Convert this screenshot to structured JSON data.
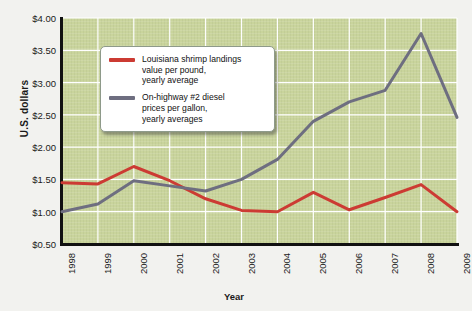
{
  "chart_data": {
    "type": "line",
    "title": "",
    "xlabel": "Year",
    "ylabel": "U.S. dollars",
    "categories": [
      "1998",
      "1999",
      "2000",
      "2001",
      "2002",
      "2003",
      "2004",
      "2005",
      "2006",
      "2007",
      "2008",
      "2009"
    ],
    "ylim": [
      0.5,
      4.0
    ],
    "yticks": [
      "$0.50",
      "$1.00",
      "$1.50",
      "$2.00",
      "$2.50",
      "$3.00",
      "$3.50",
      "$4.00"
    ],
    "ytick_values": [
      0.5,
      1.0,
      1.5,
      2.0,
      2.5,
      3.0,
      3.5,
      4.0
    ],
    "grid": true,
    "legend_position": "top-left-inside",
    "series": [
      {
        "name": "Louisiana shrimp landings value per pound, yearly average",
        "color": "#cc3b33",
        "values": [
          1.45,
          1.43,
          1.7,
          1.48,
          1.2,
          1.02,
          1.0,
          1.3,
          1.03,
          1.22,
          1.42,
          1.0
        ]
      },
      {
        "name": "On-highway #2 diesel prices per gallon, yearly averages",
        "color": "#6e6e80",
        "values": [
          1.0,
          1.12,
          1.48,
          1.4,
          1.32,
          1.5,
          1.81,
          2.4,
          2.7,
          2.88,
          3.76,
          2.46
        ]
      }
    ]
  },
  "legend": {
    "items": [
      {
        "label": "Louisiana shrimp landings\nvalue per pound,\nyearly average",
        "line1": "Louisiana shrimp landings",
        "line2": "value per pound,",
        "line3": "yearly average",
        "color": "#cc3b33"
      },
      {
        "label": "On-highway #2 diesel\nprices per gallon,\nyearly averages",
        "line1": "On-highway #2 diesel",
        "line2": "prices per gallon,",
        "line3": "yearly averages",
        "color": "#6e6e80"
      }
    ]
  },
  "axes": {
    "y_title": "U.S. dollars",
    "x_title": "Year"
  },
  "colors": {
    "plot_background": "#c9d49c",
    "page_background": "#f2f2ef",
    "gridline": "#ffffff",
    "axis": "#111111",
    "series_shrimp": "#cc3b33",
    "series_diesel": "#6e6e80"
  }
}
